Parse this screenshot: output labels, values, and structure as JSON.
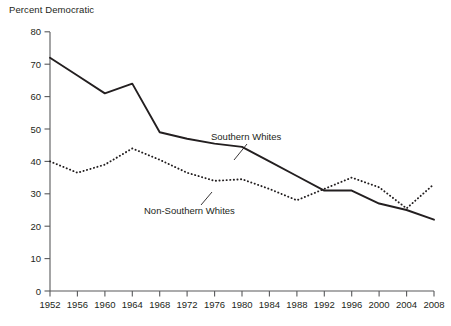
{
  "chart_data": {
    "type": "line",
    "title": "Percent Democratic",
    "xlabel": "",
    "ylabel": "Percent Democratic",
    "xlim": [
      1952,
      2008
    ],
    "ylim": [
      0,
      80
    ],
    "grid": false,
    "legend_position": "inline-annotation",
    "categories": [
      1952,
      1956,
      1960,
      1964,
      1968,
      1972,
      1976,
      1980,
      1984,
      1988,
      1992,
      1996,
      2000,
      2004,
      2008
    ],
    "x_tick_labels": [
      "1952",
      "1956",
      "1960",
      "1964",
      "1968",
      "1972",
      "1976",
      "1980",
      "1984",
      "1988",
      "1992",
      "1996",
      "2000",
      "2004",
      "2008"
    ],
    "y_tick_labels": [
      "0",
      "10",
      "20",
      "30",
      "40",
      "50",
      "60",
      "70",
      "80"
    ],
    "y_ticks": [
      0,
      10,
      20,
      30,
      40,
      50,
      60,
      70,
      80
    ],
    "series": [
      {
        "name": "Southern Whites",
        "style": "solid",
        "color": "#231f20",
        "values": [
          72,
          66.5,
          61,
          64,
          49,
          47,
          45.5,
          44.5,
          40,
          35.5,
          31,
          31,
          27,
          25,
          22
        ]
      },
      {
        "name": "Non-Southern Whites",
        "style": "dotted",
        "color": "#231f20",
        "values": [
          40,
          36.5,
          39,
          44,
          40.5,
          36.5,
          34,
          34.5,
          31.5,
          28,
          31.5,
          35,
          32,
          25.5,
          33
        ]
      }
    ],
    "annotations": [
      {
        "text": "Southern Whites",
        "x": 1984,
        "y": 52
      },
      {
        "text": "Non-Southern Whites",
        "x": 1972,
        "y": 23.5
      }
    ]
  }
}
